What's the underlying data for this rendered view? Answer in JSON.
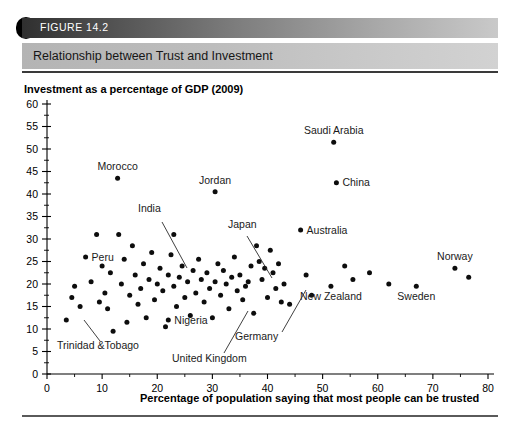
{
  "figure": {
    "number": "FIGURE 14.2",
    "title": "Relationship between Trust and Investment"
  },
  "chart_data": {
    "type": "scatter",
    "title": "Relationship between Trust and Investment",
    "xlabel": "Percentage of population saying that most people can be trusted",
    "ylabel": "Investment as a percentage of GDP (2009)",
    "xlim": [
      0,
      80
    ],
    "ylim": [
      0,
      60
    ],
    "x_ticks": [
      0,
      10,
      20,
      30,
      40,
      50,
      60,
      70,
      80
    ],
    "x_minor_step": 5,
    "y_ticks": [
      0,
      5,
      10,
      15,
      20,
      25,
      30,
      35,
      40,
      45,
      50,
      55,
      60
    ],
    "y_minor_step": 2.5,
    "grid": false,
    "legend": "none",
    "labeled_points": [
      {
        "name": "Saudi Arabia",
        "x": 52.0,
        "y": 51.5,
        "label_pos": "above"
      },
      {
        "name": "China",
        "x": 52.5,
        "y": 42.5,
        "label_pos": "right"
      },
      {
        "name": "Morocco",
        "x": 12.8,
        "y": 43.5,
        "label_pos": "above"
      },
      {
        "name": "Jordan",
        "x": 30.5,
        "y": 40.5,
        "label_pos": "above"
      },
      {
        "name": "India",
        "x": 23.0,
        "y": 31.0,
        "label_pos": "leader-down-right"
      },
      {
        "name": "Japan",
        "x": 38.5,
        "y": 25.0,
        "label_pos": "leader-down-left"
      },
      {
        "name": "Australia",
        "x": 46.0,
        "y": 32.0,
        "label_pos": "right"
      },
      {
        "name": "Peru",
        "x": 7.0,
        "y": 26.0,
        "label_pos": "right"
      },
      {
        "name": "Norway",
        "x": 74.0,
        "y": 23.5,
        "label_pos": "above"
      },
      {
        "name": "Sweden",
        "x": 67.0,
        "y": 19.5,
        "label_pos": "below"
      },
      {
        "name": "New Zealand",
        "x": 51.5,
        "y": 19.5,
        "label_pos": "below"
      },
      {
        "name": "Germany",
        "x": 36.5,
        "y": 20.5,
        "label_pos": "leader-down-left"
      },
      {
        "name": "United Kingdom",
        "x": 30.5,
        "y": 20.5,
        "label_pos": "leader-down-left"
      },
      {
        "name": "Nigeria",
        "x": 22.0,
        "y": 12.0,
        "label_pos": "right"
      },
      {
        "name": "Trinidad &Tobago",
        "x": 3.5,
        "y": 12.0,
        "label_pos": "leader-down-right"
      }
    ],
    "points": [
      [
        3.5,
        12.0
      ],
      [
        4.5,
        17.0
      ],
      [
        5.0,
        19.5
      ],
      [
        6.0,
        15.0
      ],
      [
        7.0,
        26.0
      ],
      [
        8.0,
        20.5
      ],
      [
        9.0,
        31.0
      ],
      [
        9.5,
        16.0
      ],
      [
        10.0,
        24.0
      ],
      [
        10.5,
        18.0
      ],
      [
        11.0,
        14.5
      ],
      [
        11.5,
        22.5
      ],
      [
        12.0,
        9.5
      ],
      [
        12.8,
        43.5
      ],
      [
        13.0,
        31.0
      ],
      [
        13.5,
        20.0
      ],
      [
        14.0,
        25.5
      ],
      [
        14.5,
        11.5
      ],
      [
        15.0,
        17.5
      ],
      [
        15.5,
        28.5
      ],
      [
        16.0,
        22.0
      ],
      [
        16.5,
        15.5
      ],
      [
        17.0,
        19.0
      ],
      [
        17.5,
        24.5
      ],
      [
        18.0,
        12.5
      ],
      [
        18.5,
        21.0
      ],
      [
        19.0,
        27.0
      ],
      [
        19.5,
        16.5
      ],
      [
        20.0,
        20.0
      ],
      [
        20.5,
        23.5
      ],
      [
        21.0,
        18.5
      ],
      [
        21.5,
        10.5
      ],
      [
        22.0,
        12.0
      ],
      [
        22.0,
        22.0
      ],
      [
        22.5,
        26.5
      ],
      [
        23.0,
        31.0
      ],
      [
        23.0,
        19.5
      ],
      [
        23.5,
        15.0
      ],
      [
        24.0,
        21.5
      ],
      [
        24.5,
        24.0
      ],
      [
        25.0,
        17.0
      ],
      [
        25.5,
        20.5
      ],
      [
        26.0,
        13.0
      ],
      [
        26.5,
        23.0
      ],
      [
        27.0,
        18.0
      ],
      [
        27.5,
        25.5
      ],
      [
        28.0,
        21.0
      ],
      [
        28.5,
        16.0
      ],
      [
        29.0,
        22.5
      ],
      [
        29.5,
        19.0
      ],
      [
        30.0,
        12.5
      ],
      [
        30.5,
        40.5
      ],
      [
        30.5,
        20.5
      ],
      [
        31.0,
        24.5
      ],
      [
        31.5,
        17.5
      ],
      [
        32.0,
        23.0
      ],
      [
        32.5,
        20.0
      ],
      [
        33.0,
        14.5
      ],
      [
        33.5,
        21.5
      ],
      [
        34.0,
        26.0
      ],
      [
        34.5,
        18.5
      ],
      [
        35.0,
        22.0
      ],
      [
        35.5,
        16.5
      ],
      [
        36.0,
        19.5
      ],
      [
        36.5,
        20.5
      ],
      [
        37.0,
        24.0
      ],
      [
        37.5,
        13.5
      ],
      [
        38.0,
        28.5
      ],
      [
        38.5,
        25.0
      ],
      [
        39.0,
        21.0
      ],
      [
        39.5,
        23.5
      ],
      [
        40.0,
        17.0
      ],
      [
        40.5,
        27.5
      ],
      [
        41.0,
        22.5
      ],
      [
        41.5,
        19.0
      ],
      [
        42.0,
        24.5
      ],
      [
        42.5,
        16.0
      ],
      [
        43.0,
        20.0
      ],
      [
        44.0,
        15.5
      ],
      [
        46.0,
        32.0
      ],
      [
        47.0,
        22.0
      ],
      [
        48.0,
        17.5
      ],
      [
        51.5,
        19.5
      ],
      [
        52.0,
        51.5
      ],
      [
        52.5,
        42.5
      ],
      [
        54.0,
        24.0
      ],
      [
        55.5,
        21.0
      ],
      [
        58.5,
        22.5
      ],
      [
        62.0,
        20.0
      ],
      [
        67.0,
        19.5
      ],
      [
        74.0,
        23.5
      ],
      [
        76.5,
        21.5
      ]
    ]
  }
}
